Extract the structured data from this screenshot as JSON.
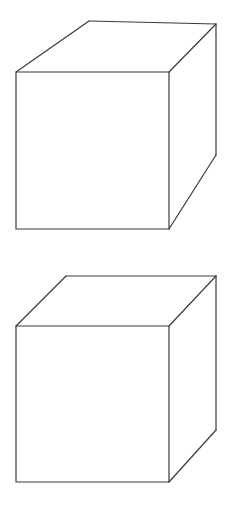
{
  "page": {
    "width": 244,
    "height": 513,
    "background_color": "#ffffff"
  },
  "style": {
    "line_color": "#3a3a3a",
    "line_width": 1.2,
    "face_fill": "#ffffff"
  },
  "figures": [
    {
      "name": "cube-top",
      "label": "Upper cube",
      "front_face": {
        "points": "16,72 169,72 169,229 16,229",
        "corners": {
          "top_left": [
            16,
            72
          ],
          "top_right": [
            169,
            72
          ],
          "bottom_right": [
            169,
            229
          ],
          "bottom_left": [
            16,
            229
          ]
        }
      },
      "top_face": {
        "points": "16,72 89,21 216,24 169,72"
      },
      "right_face": {
        "points": "169,72 216,24 216,155 169,229"
      },
      "edges": {
        "front_rect": "M16,72 L169,72 L169,229 L16,229 Z",
        "top_back_left": "M16,72 L89,21",
        "top_back_edge": "M89,21 L216,24",
        "top_back_right": "M216,24 L169,72",
        "right_vertical_back": "M216,24 L216,155",
        "right_bottom_diagonal": "M216,155 L169,229"
      }
    },
    {
      "name": "cube-bottom",
      "label": "Lower cube",
      "front_face": {
        "points": "16,326 169,326 169,482 16,482",
        "corners": {
          "top_left": [
            16,
            326
          ],
          "top_right": [
            169,
            326
          ],
          "bottom_right": [
            169,
            482
          ],
          "bottom_left": [
            16,
            482
          ]
        }
      },
      "top_face": {
        "points": "16,326 66,276 216,276 169,326"
      },
      "right_face": {
        "points": "169,326 216,276 216,430 169,482"
      },
      "edges": {
        "front_rect": "M16,326 L169,326 L169,482 L16,482 Z",
        "top_back_left": "M16,326 L66,276",
        "top_back_edge": "M66,276 L216,276",
        "top_back_right": "M216,276 L169,326",
        "right_vertical_back": "M216,276 L216,430",
        "right_bottom_diagonal": "M216,430 L169,482"
      }
    }
  ]
}
